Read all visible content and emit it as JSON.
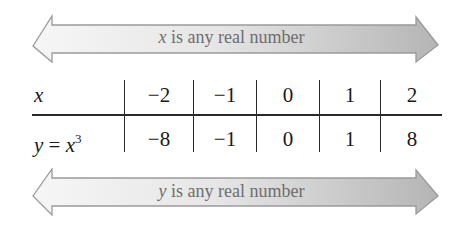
{
  "top_arrow": {
    "variable": "x",
    "text": " is any real number"
  },
  "table": {
    "row_x": {
      "label": "x",
      "values": [
        "−2",
        "−1",
        "0",
        "1",
        "2"
      ]
    },
    "row_y": {
      "label_var": "y",
      "label_eq": " = ",
      "label_base": "x",
      "label_exp": "3",
      "values": [
        "−8",
        "−1",
        "0",
        "1",
        "8"
      ]
    }
  },
  "bottom_arrow": {
    "variable": "y",
    "text": " is any real number"
  },
  "colors": {
    "arrow_fill_light": "#f4f4f4",
    "arrow_fill_dark": "#b8b8b8",
    "arrow_stroke": "#9a9a9a",
    "text_gray": "#6e6e6e",
    "table_ink": "#1a1a1a"
  }
}
